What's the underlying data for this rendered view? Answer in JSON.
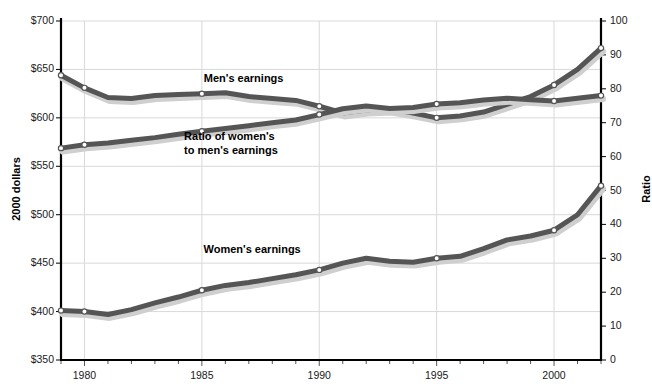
{
  "chart_data": {
    "type": "line",
    "title": "",
    "subtitle": "",
    "xlabel": "",
    "ylabel": "2000 dollars",
    "ylabel_right": "Ratio",
    "xlim": [
      1979,
      2002
    ],
    "ylim": [
      350,
      700
    ],
    "ylim_right": [
      0,
      100
    ],
    "grid": true,
    "legend_position": "inline-annotations",
    "x": [
      1979,
      1980,
      1981,
      1982,
      1983,
      1984,
      1985,
      1986,
      1987,
      1988,
      1989,
      1990,
      1991,
      1992,
      1993,
      1994,
      1995,
      1996,
      1997,
      1998,
      1999,
      2000,
      2001,
      2002
    ],
    "x_ticks": [
      1980,
      1985,
      1990,
      1995,
      2000
    ],
    "x_tick_labels": [
      "1980",
      "1985",
      "1990",
      "1995",
      "2000"
    ],
    "y_ticks_left": [
      350,
      400,
      450,
      500,
      550,
      600,
      650,
      700
    ],
    "y_tick_labels_left": [
      "$350",
      "$400",
      "$450",
      "$500",
      "$550",
      "$600",
      "$650",
      "$700"
    ],
    "y_ticks_right": [
      0,
      10,
      20,
      30,
      40,
      50,
      60,
      70,
      80,
      90,
      100
    ],
    "y_tick_labels_right": [
      "0",
      "10",
      "20",
      "30",
      "40",
      "50",
      "60",
      "70",
      "80",
      "90",
      "100"
    ],
    "series": [
      {
        "name": "Men's earnings",
        "axis": "left",
        "color": "#555555",
        "label_text": "Men's earnings",
        "label_x": 1987.0,
        "label_y": 641,
        "values": [
          644,
          631,
          621,
          620,
          623,
          624,
          625,
          626,
          622,
          620,
          618,
          612,
          605,
          608,
          609,
          605,
          600,
          602,
          606,
          614,
          622,
          634,
          650,
          672
        ],
        "markers_at": [
          1979,
          1980,
          1985,
          1990,
          1995,
          2000,
          2002
        ],
        "marker_values": [
          644,
          631,
          625,
          612,
          600,
          634,
          672
        ]
      },
      {
        "name": "Women's earnings",
        "axis": "left",
        "color": "#555555",
        "label_text": "Women's earnings",
        "label_x": 1987.5,
        "label_y": 465,
        "values": [
          401,
          400,
          397,
          402,
          409,
          415,
          422,
          427,
          430,
          434,
          438,
          443,
          450,
          455,
          452,
          451,
          455,
          457,
          465,
          474,
          478,
          484,
          500,
          530
        ],
        "markers_at": [
          1979,
          1980,
          1985,
          1990,
          1995,
          2000,
          2002
        ],
        "marker_values": [
          401,
          400,
          422,
          443,
          455,
          484,
          530
        ]
      },
      {
        "name": "Ratio of women's to men's earnings",
        "axis": "right",
        "color": "#555555",
        "label_text_line1": "Ratio of women's",
        "label_text_line2": "to men's earnings",
        "label_x": 1986.5,
        "label_y": 66,
        "values": [
          62.5,
          63.5,
          64.0,
          64.8,
          65.6,
          66.6,
          67.5,
          68.3,
          69.1,
          70.0,
          70.8,
          72.4,
          74.1,
          74.9,
          74.2,
          74.5,
          75.5,
          75.9,
          76.7,
          77.2,
          76.8,
          76.4,
          77.2,
          78.0
        ],
        "markers_at": [
          1979,
          1980,
          1985,
          1990,
          1995,
          2000,
          2002
        ],
        "marker_values": [
          62.5,
          63.5,
          67.5,
          72.4,
          75.5,
          76.4,
          78.0
        ]
      }
    ],
    "note_shadow_color": "#cfcfcf",
    "axis_color": "#000000",
    "grid_color": "#d9d9d9"
  }
}
